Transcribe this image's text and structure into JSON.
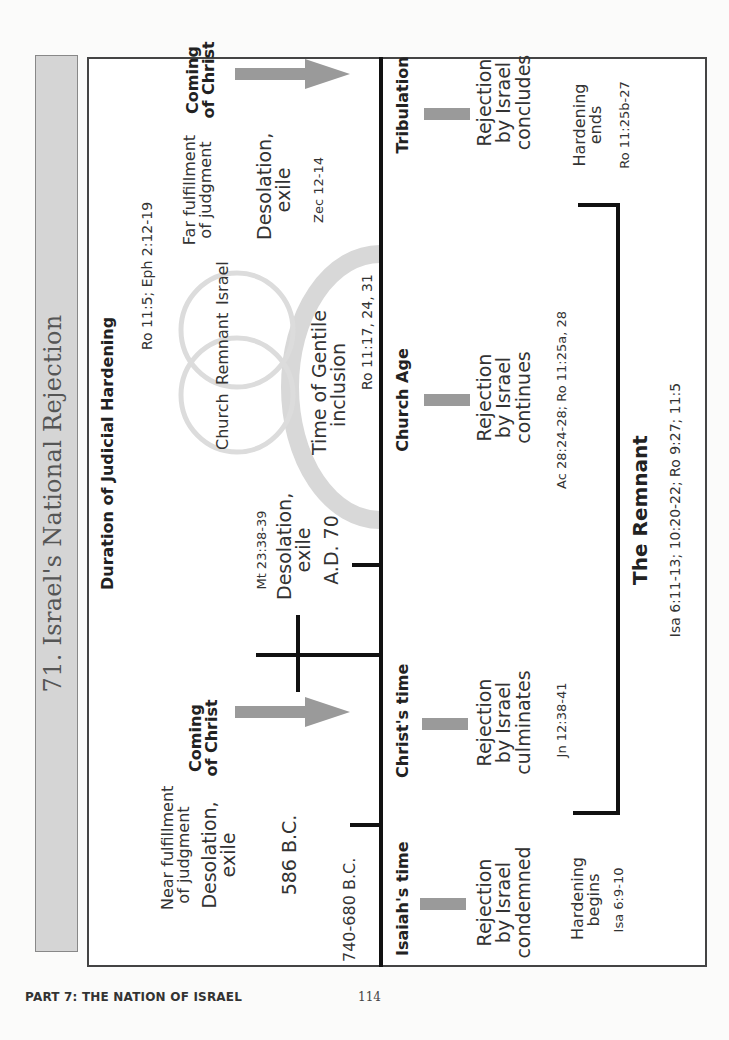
{
  "title": "71. Israel's National Rejection",
  "footer": {
    "section": "PART 7: THE NATION OF ISRAEL",
    "page_number": "114"
  },
  "upper": {
    "duration_heading": "Duration of Judicial Hardening",
    "duration_ref": "Ro 11:5; Eph 2:12-19",
    "near": {
      "line1": "Near fulfillment",
      "line2": "of judgment",
      "desolation1": "Desolation,",
      "desolation2": "exile",
      "date": "586 B.C."
    },
    "isaiah_date": "740-680 B.C.",
    "coming_of_christ_1": {
      "line1": "Coming",
      "line2": "of Christ"
    },
    "ad70": {
      "ref": "Mt 23:38-39",
      "line1": "Desolation,",
      "line2": "exile",
      "date": "A.D. 70"
    },
    "circles": {
      "church": "Church",
      "remnant": "Remnant",
      "israel": "Israel"
    },
    "gentile": {
      "line1": "Time of Gentile",
      "line2": "inclusion",
      "ref": "Ro 11:17, 24, 31"
    },
    "far": {
      "line1": "Far fulfillment",
      "line2": "of judgment",
      "desolation1": "Desolation,",
      "desolation2": "exile",
      "ref": "Zec 12-14"
    },
    "coming_of_christ_2": {
      "line1": "Coming",
      "line2": "of Christ"
    }
  },
  "lower": {
    "periods": [
      {
        "heading": "Isaiah's time",
        "line1": "Rejection",
        "line2": "by Israel",
        "line3": "condemned",
        "ref": ""
      },
      {
        "heading": "Christ's time",
        "line1": "Rejection",
        "line2": "by Israel",
        "line3": "culminates",
        "ref": "Jn 12:38-41"
      },
      {
        "heading": "Church Age",
        "line1": "Rejection",
        "line2": "by Israel",
        "line3": "continues",
        "ref": "Ac 28:24-28; Ro 11:25a, 28"
      },
      {
        "heading": "Tribulation",
        "line1": "Rejection",
        "line2": "by Israel",
        "line3": "concludes",
        "ref": ""
      }
    ],
    "hardening_begins": {
      "line1": "Hardening",
      "line2": "begins",
      "ref": "Isa 6:9-10"
    },
    "hardening_ends": {
      "line1": "Hardening",
      "line2": "ends",
      "ref": "Ro 11:25b-27"
    },
    "remnant": {
      "heading": "The Remnant",
      "ref": "Isa 6:11-13; 10:20-22; Ro 9:27; 11:5"
    }
  },
  "colors": {
    "title_strip": "#d5d5d5",
    "arrow": "#999999",
    "rings": "#dcdcdc",
    "timeline": "#111111"
  }
}
